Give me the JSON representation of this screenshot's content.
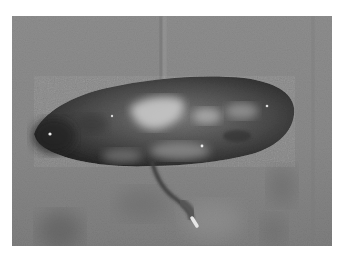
{
  "image": {
    "kind": "photograph",
    "mode": "grayscale",
    "subject": "excised elongated tissue specimen with attached cord on surgical drape",
    "colors": {
      "background_page": "#ffffff",
      "drape": "#8a8a8a",
      "drape_dark": "#6e6e6e",
      "specimen_dark": "#2a2a2a",
      "specimen_mid": "#5a5a5a",
      "specimen_light": "#c8c8c8",
      "cord": "#4a4a4a",
      "cord_tip": "#e0e0e0"
    }
  }
}
